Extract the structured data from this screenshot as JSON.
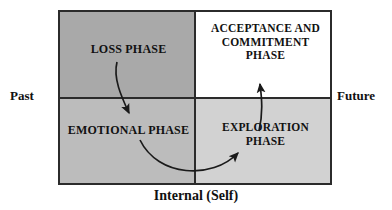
{
  "diagram": {
    "title_visible": false,
    "axes": {
      "left_label": "Past",
      "right_label": "Future",
      "bottom_label": "Internal (Self)"
    },
    "quadrants": [
      {
        "id": "loss",
        "position": "top-left",
        "label": "LOSS PHASE",
        "fill": "#a9a9a9"
      },
      {
        "id": "acceptance-commitment",
        "position": "top-right",
        "label": "ACCEPTANCE AND\nCOMMITMENT\nPHASE",
        "fill": "#ffffff"
      },
      {
        "id": "emotional",
        "position": "bottom-left",
        "label": "EMOTIONAL PHASE",
        "fill": "#bcbcbc"
      },
      {
        "id": "exploration",
        "position": "bottom-right",
        "label": "EXPLORATION\nPHASE",
        "fill": "#d2d2d2"
      }
    ],
    "flow_arrows": [
      {
        "id": "loss-to-emotional",
        "from": "loss",
        "to": "emotional"
      },
      {
        "id": "emotional-to-exploration",
        "from": "emotional",
        "to": "exploration"
      },
      {
        "id": "exploration-to-acceptance",
        "from": "exploration",
        "to": "acceptance-commitment"
      }
    ],
    "colors": {
      "border": "#2b2b2b",
      "text": "#111111",
      "arrow": "#1a1a1a"
    }
  }
}
